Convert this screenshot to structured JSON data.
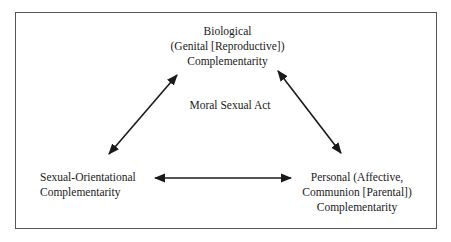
{
  "diagram": {
    "center_label": "Moral Sexual Act",
    "nodes": {
      "top": {
        "lines": [
          "Biological",
          "(Genital [Reproductive])",
          "Complementarity"
        ]
      },
      "bottom_left": {
        "lines": [
          "Sexual-Orientational",
          "Complementarity"
        ]
      },
      "bottom_right": {
        "lines": [
          "Personal (Affective,",
          "Communion [Parental])",
          "Complementarity"
        ]
      }
    },
    "edges": [
      {
        "from": "top",
        "to": "bottom_left",
        "type": "bidirectional-arrow"
      },
      {
        "from": "top",
        "to": "bottom_right",
        "type": "bidirectional-arrow"
      },
      {
        "from": "bottom_left",
        "to": "bottom_right",
        "type": "bidirectional-arrow"
      }
    ],
    "colors": {
      "line": "#1a1a1a",
      "frame": "#555555",
      "background": "#ffffff"
    }
  }
}
